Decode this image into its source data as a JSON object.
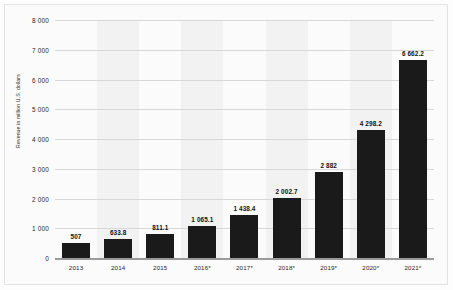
{
  "chart_data": {
    "type": "bar",
    "title": "",
    "subtitle": "",
    "xlabel": "",
    "ylabel": "Revenue in million U.S. dollars",
    "categories": [
      "2013",
      "2014",
      "2015",
      "2016*",
      "2017*",
      "2018*",
      "2019*",
      "2020*",
      "2021*"
    ],
    "values": [
      507,
      633.8,
      811.1,
      1065.1,
      1438.4,
      2002.7,
      2882,
      4298.2,
      6662.2
    ],
    "value_labels": [
      "507",
      "633.8",
      "811.1",
      "1 065.1",
      "1 438.4",
      "2 002.7",
      "2 882",
      "4 298.2",
      "6 662.2"
    ],
    "ylim": [
      0,
      8000
    ],
    "yticks": [
      0,
      1000,
      2000,
      3000,
      4000,
      5000,
      6000,
      7000,
      8000
    ],
    "ytick_labels": [
      "0",
      "1 000",
      "2 000",
      "3 000",
      "4 000",
      "5 000",
      "6 000",
      "7 000",
      "8 000"
    ],
    "grid": true,
    "legend": false,
    "legend_position": "none",
    "bar_color": "#1a1a1a",
    "grid_color": "#d8d8d8",
    "band_color": "#f2f2f2",
    "background_color": "#fbfbfb",
    "axis_color": "#9a9a9a",
    "banded_columns": [
      1,
      3,
      5,
      7
    ]
  }
}
